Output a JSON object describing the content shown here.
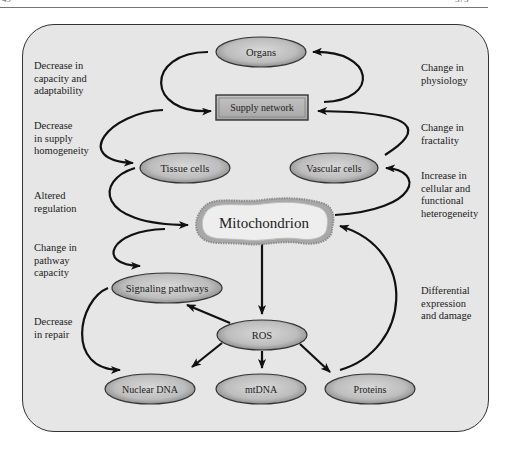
{
  "page_header": {
    "left": "49",
    "right": "373"
  },
  "nodes": {
    "organs": "Organs",
    "supply_network": "Supply network",
    "tissue_cells": "Tissue cells",
    "vascular_cells": "Vascular cells",
    "mitochondrion": "Mitochondrion",
    "signaling_pathways": "Signaling pathways",
    "ros": "ROS",
    "nuclear_dna": "Nuclear DNA",
    "mtdna": "mtDNA",
    "proteins": "Proteins"
  },
  "left_labels": [
    "Decrease in\ncapacity and\nadaptability",
    "Decrease\nin supply\nhomogeneity",
    "Altered\nregulation",
    "Change in\npathway\ncapacity",
    "Decrease\nin repair"
  ],
  "right_labels": [
    "Change in\nphysiology",
    "Change in\nfractality",
    "Increase in\ncellular and\nfunctional\nheterogeneity",
    "Differential\nexpression\nand damage"
  ],
  "colors": {
    "panel_bg": "#e6e6e6",
    "node_fill_center": "#d2d2d2",
    "node_fill_edge": "#8a8a8a",
    "node_stroke": "#333333",
    "arrow": "#111111",
    "mito_outline": "#9a9a9a"
  }
}
